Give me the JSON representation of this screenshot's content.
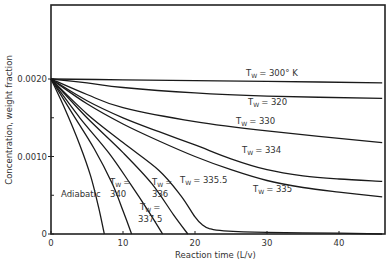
{
  "chart_data": {
    "type": "line",
    "title": "",
    "xlabel": "Reaction time (L/v)",
    "ylabel": "Concentration, weight fraction",
    "xlim": [
      0,
      46
    ],
    "ylim": [
      0,
      0.0028
    ],
    "x_ticks": [
      0,
      10,
      20,
      30,
      40
    ],
    "y_ticks": [
      0,
      0.001,
      0.002
    ],
    "y_tick_labels": [
      "0",
      "0.0010",
      "0.0020"
    ],
    "x_tick_labels": [
      "0",
      "10",
      "20",
      "30",
      "40"
    ],
    "grid": false,
    "series": [
      {
        "name": "Tw = 300° K",
        "x": [
          0,
          10,
          20,
          30,
          46
        ],
        "y": [
          0.002,
          0.00199,
          0.00198,
          0.00197,
          0.00195
        ]
      },
      {
        "name": "Tw = 320",
        "x": [
          0,
          5,
          10,
          20,
          30,
          46
        ],
        "y": [
          0.002,
          0.00195,
          0.00189,
          0.00182,
          0.00178,
          0.00175
        ]
      },
      {
        "name": "Tw = 330",
        "x": [
          0,
          5,
          10,
          20,
          30,
          46
        ],
        "y": [
          0.002,
          0.0018,
          0.00163,
          0.00145,
          0.00133,
          0.00118
        ]
      },
      {
        "name": "Tw = 334",
        "x": [
          0,
          5,
          10,
          15,
          20,
          25,
          30,
          35,
          40,
          46
        ],
        "y": [
          0.002,
          0.00172,
          0.0015,
          0.00132,
          0.00115,
          0.00097,
          0.00083,
          0.00075,
          0.00071,
          0.00068
        ]
      },
      {
        "name": "Tw = 335",
        "x": [
          0,
          5,
          10,
          15,
          20,
          25,
          30,
          35,
          40,
          46
        ],
        "y": [
          0.002,
          0.00168,
          0.00142,
          0.0012,
          0.001,
          0.00083,
          0.00069,
          0.0006,
          0.00054,
          0.00048
        ]
      },
      {
        "name": "Tw = 335.5",
        "x": [
          0,
          5,
          10,
          15,
          18,
          20,
          21,
          22,
          24,
          30,
          40,
          46
        ],
        "y": [
          0.002,
          0.00155,
          0.00118,
          0.00082,
          0.0005,
          0.00022,
          0.00012,
          7e-05,
          4e-05,
          2e-05,
          1e-05,
          0.0
        ]
      },
      {
        "name": "Tw = 337.5",
        "x": [
          0,
          5,
          10,
          14,
          17,
          19
        ],
        "y": [
          0.002,
          0.0015,
          0.00105,
          0.00065,
          0.00025,
          0.0
        ]
      },
      {
        "name": "Tw = 336",
        "x": [
          0,
          4,
          8,
          11,
          13.5,
          15.5
        ],
        "y": [
          0.002,
          0.0015,
          0.00105,
          0.00065,
          0.0003,
          0.0
        ]
      },
      {
        "name": "Tw = 340",
        "x": [
          0,
          3,
          6,
          8.5,
          10,
          11.2
        ],
        "y": [
          0.002,
          0.00155,
          0.0011,
          0.00065,
          0.0003,
          0.0
        ]
      },
      {
        "name": "Adiabatic",
        "x": [
          0,
          2,
          4,
          5.5,
          6.6,
          7.4
        ],
        "y": [
          0.002,
          0.0016,
          0.00115,
          0.00075,
          0.00035,
          0.0
        ]
      }
    ],
    "annotations": [
      {
        "text": "Tw = 300° K",
        "x": 28,
        "y": 0.00208
      },
      {
        "text": "Tw = 320",
        "x": 26,
        "y": 0.00172
      },
      {
        "text": "Tw = 330",
        "x": 30,
        "y": 0.00145
      },
      {
        "text": "Tw = 334",
        "x": 33,
        "y": 0.001
      },
      {
        "text": "Tw = 335",
        "x": 38,
        "y": 0.0004
      },
      {
        "text": "Tw = 335.5",
        "x": 18,
        "y": 0.00065
      },
      {
        "text": "Tw = 336",
        "x": 14,
        "y": 0.0006
      },
      {
        "text": "Tw = 337.5",
        "x": 11.5,
        "y": 0.0003
      },
      {
        "text": "Tw = 340",
        "x": 8.5,
        "y": 0.0006
      },
      {
        "text": "Adiabatic",
        "x": 2.5,
        "y": 0.0005
      }
    ]
  },
  "labels": {
    "y_axis": "Concentration, weight fraction",
    "x_axis": "Reaction time (L/v)",
    "t300_a": "T",
    "t300_sub": "W",
    "t300_b": "= 300° K",
    "t320_b": "= 320",
    "t330_b": "= 330",
    "t334_b": "= 334",
    "t335_b": "= 335",
    "t3355_b": "= 335.5",
    "t336_a": "T",
    "t336_b": "=",
    "t336_v": "336",
    "t3375_b": "=",
    "t3375_v": "337.5",
    "t340_b": "=",
    "t340_v": "340",
    "adiabatic": "Adiabatic",
    "sub": "W"
  }
}
